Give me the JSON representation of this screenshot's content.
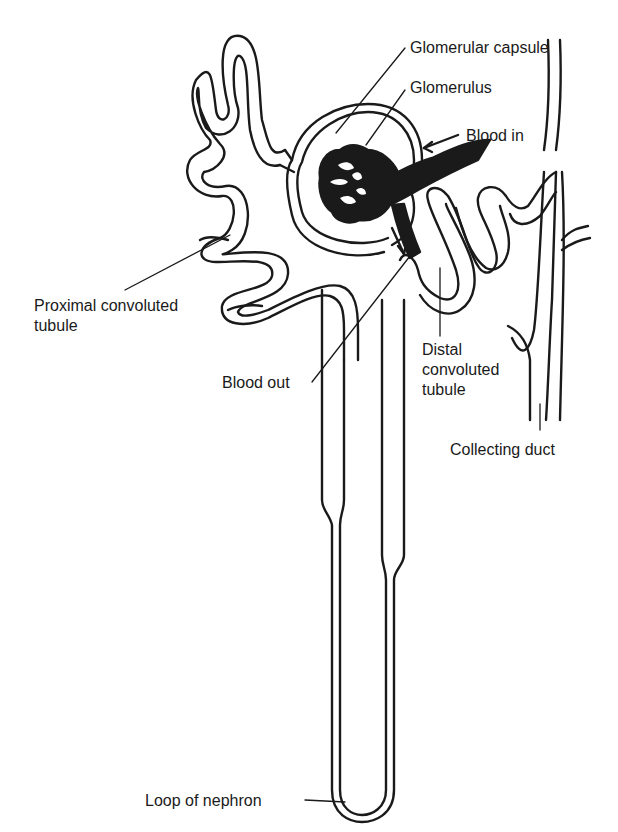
{
  "diagram": {
    "subject": "Nephron",
    "colors": {
      "ink": "#1a1a1a",
      "background": "#ffffff"
    },
    "labels": {
      "glomerular_capsule": "Glomerular capsule",
      "glomerulus": "Glomerulus",
      "blood_in": "Blood in",
      "proximal_convoluted_tubule": "Proximal convoluted\ntubule",
      "blood_out": "Blood out",
      "distal_convoluted_tubule": "Distal\nconvoluted\ntubule",
      "collecting_duct": "Collecting duct",
      "loop_of_nephron": "Loop of nephron"
    }
  }
}
